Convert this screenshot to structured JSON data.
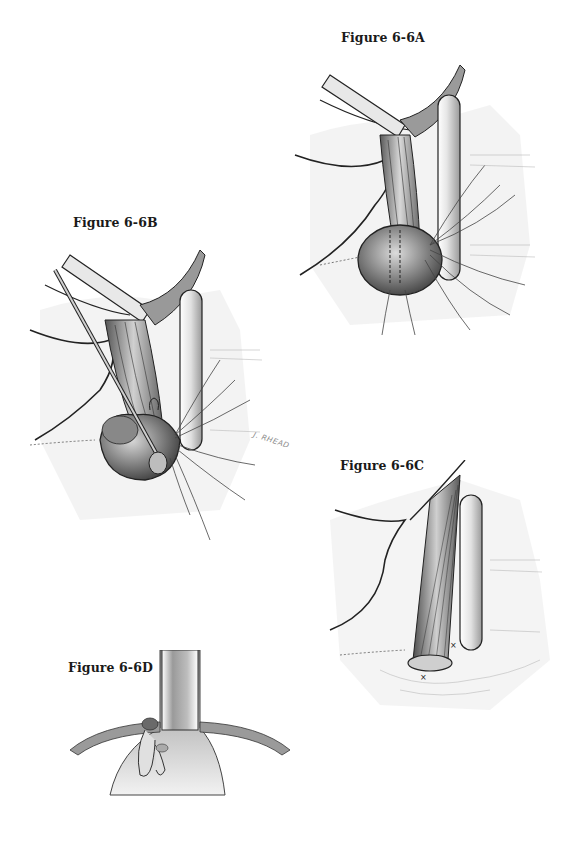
{
  "figures": [
    {
      "id": "A",
      "label": "Figure 6-6A"
    },
    {
      "id": "B",
      "label": "Figure 6-6B"
    },
    {
      "id": "C",
      "label": "Figure 6-6C"
    },
    {
      "id": "D",
      "label": "Figure 6-6D"
    }
  ],
  "signature": "J. RHEAD",
  "colors": {
    "background": "#ffffff",
    "ink": "#1a1a1a",
    "shade_dark": "#3a3a3a",
    "shade_mid": "#8c8c8c",
    "shade_light": "#d6d6d6"
  }
}
